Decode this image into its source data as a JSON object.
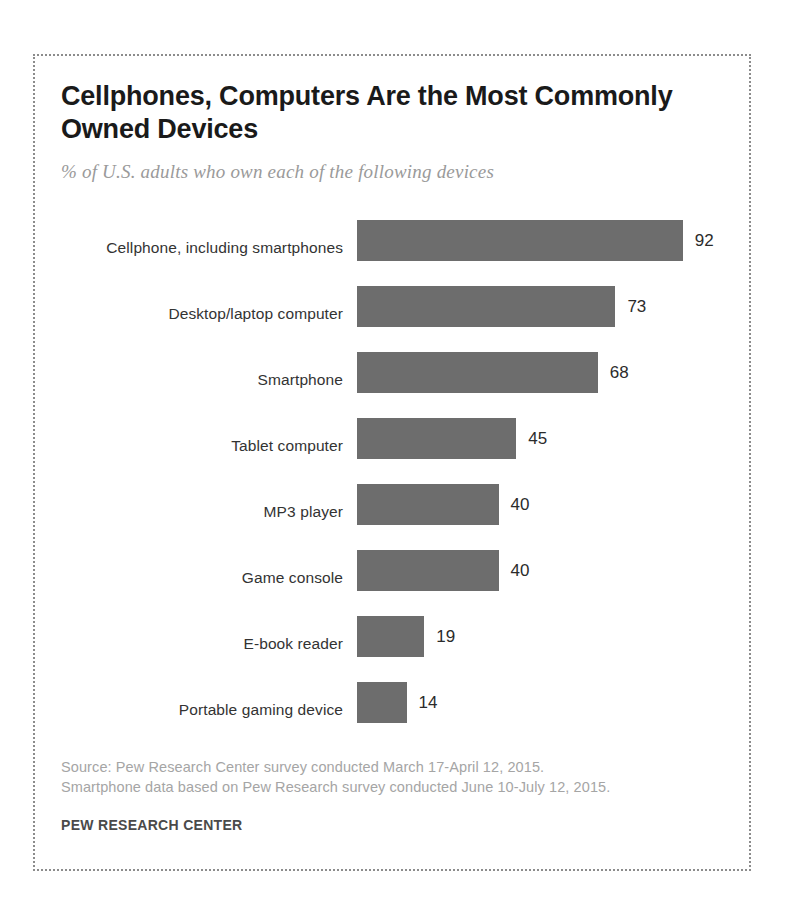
{
  "figure": {
    "title": "Cellphones, Computers Are the Most Commonly Owned Devices",
    "subtitle": "% of U.S. adults who own each of the following devices",
    "source": "Source: Pew Research Center survey conducted March 17-April 12, 2015. Smartphone data based on Pew Research survey conducted June 10-July 12, 2015.",
    "organization": "PEW RESEARCH CENTER",
    "bar_color": "#6d6d6d",
    "border_color": "#8c8c8c",
    "background": "#ffffff"
  },
  "chart_data": {
    "type": "bar",
    "orientation": "horizontal",
    "title": "Cellphones, Computers Are the Most Commonly Owned Devices",
    "subtitle": "% of U.S. adults who own each of the following devices",
    "xlabel": "",
    "ylabel": "",
    "xlim": [
      0,
      100
    ],
    "grid": false,
    "legend": false,
    "value_suffix": "",
    "categories": [
      "Cellphone, including smartphones",
      "Desktop/laptop computer",
      "Smartphone",
      "Tablet computer",
      "MP3 player",
      "Game console",
      "E-book reader",
      "Portable gaming device"
    ],
    "values": [
      92,
      73,
      68,
      45,
      40,
      40,
      19,
      14
    ],
    "labels": [
      "92",
      "73",
      "68",
      "45",
      "40",
      "40",
      "19",
      "14"
    ]
  }
}
